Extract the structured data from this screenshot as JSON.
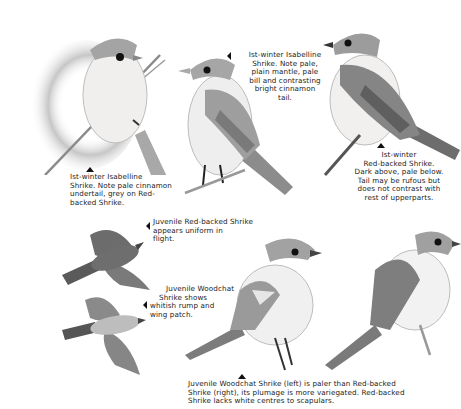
{
  "plate": {
    "title": "Isabelline, Red-backed and Woodchat Shrike identification plate",
    "colors": {
      "background": "#ffffff",
      "bird_grey": "#9a9a9a",
      "bird_dark": "#5e5e5e",
      "bird_light": "#ececec",
      "text": "#222222"
    }
  },
  "figures": [
    {
      "id": "isabelline-perched-front",
      "caption": {
        "lines": [
          "Ist-winter Isabelline",
          "Shrike. Note pale cinnamon",
          "undertail, grey on Red-",
          "backed Shrike."
        ]
      }
    },
    {
      "id": "isabelline-perched-side",
      "caption": {
        "lines": [
          "Ist-winter Isabelline",
          "Shrike. Note pale,",
          "plain mantle, pale",
          "bill and contrasting",
          "bright cinnamon",
          "tail."
        ]
      }
    },
    {
      "id": "red-backed-1st-winter",
      "caption": {
        "lines": [
          "Ist-winter",
          "Red-backed Shrike.",
          "Dark above, pale below.",
          "Tail may be rufous but",
          "does not contrast with",
          "rest of upperparts."
        ]
      }
    },
    {
      "id": "red-backed-juvenile-flight",
      "caption": {
        "lines": [
          "Juvenile Red-backed Shrike",
          "appears uniform in",
          "flight."
        ]
      }
    },
    {
      "id": "woodchat-juvenile-flight",
      "caption": {
        "lines": [
          "Juvenile Woodchat",
          "Shrike shows",
          "whitish rump and",
          "wing patch."
        ]
      }
    },
    {
      "id": "woodchat-vs-red-backed-juvenile",
      "caption": {
        "lines": [
          "Juvenile Woodchat Shrike (left) is paler than Red-backed",
          "Shrike (right), its plumage is more variegated. Red-backed",
          "Shrike lacks white centres to scapulars."
        ]
      }
    }
  ]
}
